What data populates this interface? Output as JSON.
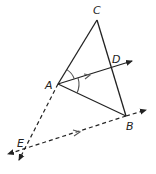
{
  "diagram": {
    "type": "geometry",
    "points": {
      "A": {
        "label": "A",
        "x": 58,
        "y": 84
      },
      "B": {
        "label": "B",
        "x": 126,
        "y": 116
      },
      "C": {
        "label": "C",
        "x": 97,
        "y": 20
      },
      "D": {
        "label": "D",
        "x": 111,
        "y": 67
      },
      "E": {
        "label": "E",
        "x": 25,
        "y": 148
      }
    },
    "segments": [
      {
        "from": "A",
        "to": "C",
        "style": "solid"
      },
      {
        "from": "C",
        "to": "B",
        "style": "solid"
      },
      {
        "from": "A",
        "to": "B",
        "style": "solid"
      },
      {
        "from": "A",
        "to": "D",
        "style": "solid",
        "ray": true,
        "parallel_mark": true
      },
      {
        "from": "A",
        "to": "E",
        "style": "dashed",
        "ray": true
      },
      {
        "from": "E",
        "to": "B",
        "style": "dashed",
        "line": true,
        "parallel_mark": true
      }
    ],
    "angle_marks": [
      {
        "vertex": "A",
        "between": [
          "C",
          "D"
        ]
      },
      {
        "vertex": "A",
        "between": [
          "D",
          "B"
        ]
      }
    ],
    "colors": {
      "stroke": "#222222",
      "arc": "#555555"
    }
  }
}
